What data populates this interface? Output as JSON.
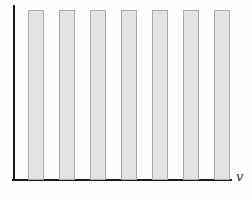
{
  "chart_data": {
    "type": "bar",
    "title": "",
    "xlabel": "v",
    "ylabel": "",
    "categories": [
      1,
      2,
      3,
      4,
      5,
      6,
      7
    ],
    "values": [
      1,
      1,
      1,
      1,
      1,
      1,
      1
    ],
    "ylim": [
      0,
      1
    ],
    "grid": false,
    "legend": "none",
    "bar_fill_color": "#e3e3e3",
    "bar_border_color": "#a8a8a8",
    "axis_color": "#1c1c1c",
    "background_color": "#fefefe"
  }
}
